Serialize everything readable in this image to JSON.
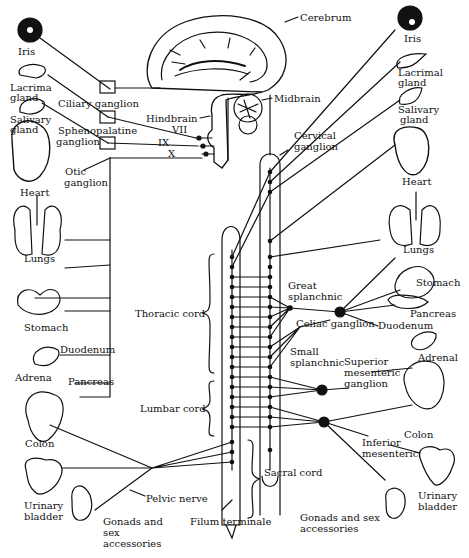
{
  "diagram": {
    "brain_labels": {
      "cerebrum": "Cerebrum",
      "midbrain": "Midbrain",
      "hindbrain": "Hindbrain",
      "nerve_vii": "VII",
      "nerve_ix": "IX",
      "nerve_x": "X"
    },
    "left_ganglia": {
      "ciliary": "Ciliary ganglion",
      "sphenopalatine_1": "Sphenopalatine",
      "sphenopalatine_2": "ganglion",
      "otic_1": "Otic",
      "otic_2": "ganglion",
      "pelvic_nerve": "Pelvic nerve"
    },
    "left_organs": {
      "iris": "Iris",
      "lacrimal_1": "Lacrima",
      "lacrimal_2": "gland",
      "salivary_1": "Salivary",
      "salivary_2": "gland",
      "heart": "Heart",
      "lungs": "Lungs",
      "stomach": "Stomach",
      "duodenum": "Duodenum",
      "adrenal": "Adrena",
      "pancreas": "Pancreas",
      "colon": "Colon",
      "bladder_1": "Urinary",
      "bladder_2": "bladder",
      "gonads_1": "Gonads and",
      "gonads_2": "sex",
      "gonads_3": "accessories"
    },
    "cord_labels": {
      "thoracic": "Thoracic cord",
      "lumbar": "Lumbar cord",
      "sacral": "Sacral cord",
      "filum": "Filum terminale"
    },
    "right_ganglia": {
      "cervical_1": "Cervical",
      "cervical_2": "ganglion",
      "great_1": "Great",
      "great_2": "splanchnic",
      "celiac": "Celiac ganglion",
      "small_1": "Small",
      "small_2": "splanchnic",
      "sup_mes_1": "Superior",
      "sup_mes_2": "mesenteric",
      "sup_mes_3": "ganglion",
      "inf_mes_1": "Inferior",
      "inf_mes_2": "mesenteric"
    },
    "right_organs": {
      "iris": "Iris",
      "lacrimal_1": "Lacrimal",
      "lacrimal_2": "gland",
      "salivary_1": "Salivary",
      "salivary_2": "gland",
      "heart": "Heart",
      "lungs": "Lungs",
      "stomach": "Stomach",
      "pancreas": "Pancreas",
      "duodenum": "Duodenum",
      "adrenal": "Adrenal",
      "colon": "Colon",
      "bladder_1": "Urinary",
      "bladder_2": "bladder",
      "gonads_1": "Gonads and sex",
      "gonads_2": "accessories"
    },
    "colors": {
      "ink": "#111111",
      "paper": "#ffffff"
    }
  }
}
